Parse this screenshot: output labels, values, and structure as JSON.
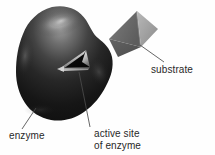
{
  "figure": {
    "background_color": "#fefefe",
    "width": 215,
    "height": 155
  },
  "labels": {
    "enzyme": "enzyme",
    "substrate": "substrate",
    "active_site_line1": "active site",
    "active_site_line2": "of enzyme"
  },
  "shapes": {
    "enzyme": {
      "name": "enzyme-blob",
      "description": "large dark rounded irregular blob with glossy specular highlight",
      "fill_dark": "#141414",
      "fill_mid": "#3a3a3a",
      "highlight_color": "#b4b4b4"
    },
    "active_site": {
      "name": "active-site-notch",
      "description": "triangular indentation in the enzyme surface",
      "edge_highlight": "#e8e8e8",
      "interior": "#0d0d0d"
    },
    "substrate": {
      "name": "substrate-pyramid",
      "description": "three dimensional tetrahedron with three visible gray faces",
      "face_left": "#6e6e6e",
      "face_right": "#a0a0a0",
      "face_bottom": "#585858"
    },
    "leader_lines": {
      "color": "#4a4a4a",
      "width": 0.8
    }
  }
}
